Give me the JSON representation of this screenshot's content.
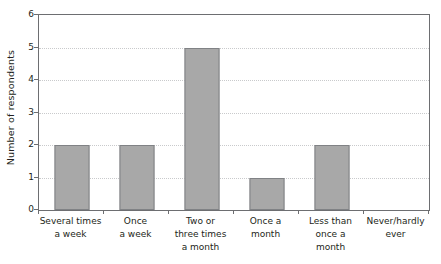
{
  "chart_data": {
    "type": "bar",
    "title": "",
    "subtitle": "",
    "xlabel": "",
    "ylabel": "Number of respondents",
    "ylim": [
      0,
      6
    ],
    "ytick_labels": [
      "0",
      "1",
      "2",
      "3",
      "4",
      "5",
      "6"
    ],
    "ytick_values": [
      0,
      1,
      2,
      3,
      4,
      5,
      6
    ],
    "gridlines": [
      1,
      2,
      3,
      4,
      5
    ],
    "grid": true,
    "legend": false,
    "legend_position": "none",
    "categories": [
      "Several times a week",
      "Once a week",
      "Two or three times a month",
      "Once a month",
      "Less than once a month",
      "Never/hardly ever"
    ],
    "category_label_lines": [
      [
        "Several times",
        "a week"
      ],
      [
        "Once",
        "a week"
      ],
      [
        "Two or",
        "three times",
        "a month"
      ],
      [
        "Once a",
        "month"
      ],
      [
        "Less than",
        "once a",
        "month"
      ],
      [
        "Never/hardly",
        "ever"
      ]
    ],
    "values": [
      2,
      2,
      5,
      1,
      2,
      0
    ],
    "bar_color": "#a8a8a8",
    "bar_border_color": "#808285",
    "axis_color": "#6d6e71",
    "grid_color": "#c9cacc",
    "text_color": "#231f20",
    "background_color": "#ffffff"
  }
}
